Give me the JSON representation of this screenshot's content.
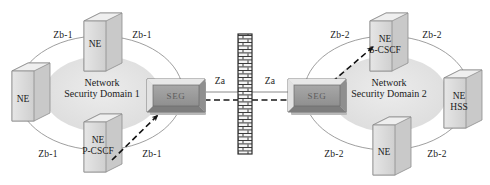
{
  "diagram": {
    "colors": {
      "node_face": "#d8d8d8",
      "node_top": "#efefef",
      "node_side": "#bdbdbd",
      "node_outline": "#8d8d8d",
      "seg_face": "#9a9a9a",
      "seg_bevel_light": "#e2e2e2",
      "seg_bevel_dark": "#6d6d6d",
      "domain_fill": "#e3e3e3",
      "domain_stroke": "#a9a9a9",
      "wall_brick": "#f2f2f2",
      "wall_mortar": "#3a3a3a",
      "line": "#6f6f6f",
      "arrow_dark": "#111111",
      "text": "#1a1a1a"
    },
    "domains": [
      {
        "id": "domain-1",
        "line1": "Network",
        "line2": "Security Domain 1"
      },
      {
        "id": "domain-2",
        "line1": "Network",
        "line2": "Security Domain 2"
      }
    ],
    "gateways": [
      {
        "id": "seg-left",
        "label": "SEG"
      },
      {
        "id": "seg-right",
        "label": "SEG"
      }
    ],
    "nodes": [
      {
        "id": "ne-left-top",
        "line1": "NE",
        "line2": ""
      },
      {
        "id": "ne-left-west",
        "line1": "NE",
        "line2": ""
      },
      {
        "id": "ne-left-bottom",
        "line1": "NE",
        "line2": "P-CSCF"
      },
      {
        "id": "ne-right-top",
        "line1": "NE",
        "line2": "S-CSCF"
      },
      {
        "id": "ne-right-east",
        "line1": "NE",
        "line2": "HSS"
      },
      {
        "id": "ne-right-bottom",
        "line1": "NE",
        "line2": ""
      }
    ],
    "interfaces": {
      "za": "Za",
      "zb1": "Zb-1",
      "zb2": "Zb-2"
    },
    "interface_labels": [
      {
        "id": "zb1-top-left",
        "text": "Zb-1"
      },
      {
        "id": "zb1-top-right",
        "text": "Zb-1"
      },
      {
        "id": "zb1-bottom-left",
        "text": "Zb-1"
      },
      {
        "id": "zb1-bottom-right",
        "text": "Zb-1"
      },
      {
        "id": "za-left",
        "text": "Za"
      },
      {
        "id": "za-right",
        "text": "Za"
      },
      {
        "id": "zb2-top-left",
        "text": "Zb-2"
      },
      {
        "id": "zb2-top-right",
        "text": "Zb-2"
      },
      {
        "id": "zb2-bottom-left",
        "text": "Zb-2"
      },
      {
        "id": "zb2-bottom-right",
        "text": "Zb-2"
      }
    ],
    "firewall": {
      "id": "firewall-wall",
      "name": "brick-wall"
    }
  }
}
